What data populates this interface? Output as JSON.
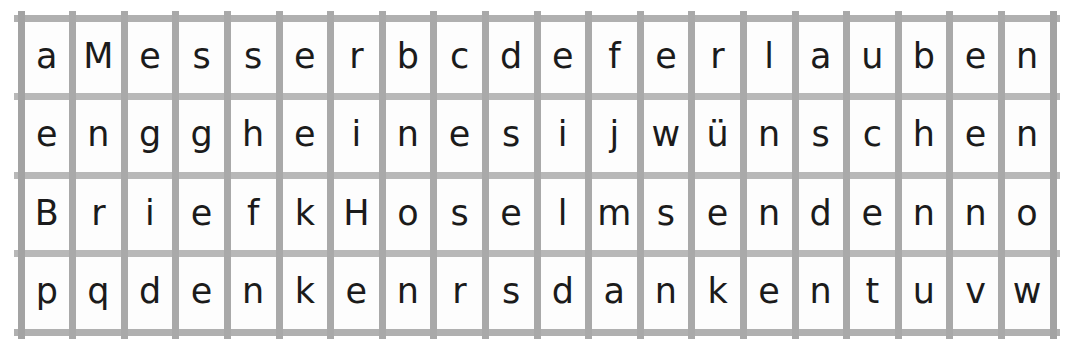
{
  "puzzle": {
    "type": "letter-grid",
    "rows": 4,
    "columns": 20,
    "grid_line_color": "#a9a9a9",
    "letter_color": "#1b1b1b",
    "cell_background": "#fdfdfd",
    "page_background": "#ffffff",
    "rows_data": [
      [
        "a",
        "M",
        "e",
        "s",
        "s",
        "e",
        "r",
        "b",
        "c",
        "d",
        "e",
        "f",
        "e",
        "r",
        "l",
        "a",
        "u",
        "b",
        "e",
        "n"
      ],
      [
        "e",
        "n",
        "g",
        "g",
        "h",
        "e",
        "i",
        "n",
        "e",
        "s",
        "i",
        "j",
        "w",
        "ü",
        "n",
        "s",
        "c",
        "h",
        "e",
        "n"
      ],
      [
        "B",
        "r",
        "i",
        "e",
        "f",
        "k",
        "H",
        "o",
        "s",
        "e",
        "l",
        "m",
        "s",
        "e",
        "n",
        "d",
        "e",
        "n",
        "n",
        "o"
      ],
      [
        "p",
        "q",
        "d",
        "e",
        "n",
        "k",
        "e",
        "n",
        "r",
        "s",
        "d",
        "a",
        "n",
        "k",
        "e",
        "n",
        "t",
        "u",
        "v",
        "w"
      ]
    ],
    "row_strings": [
      "aMesserbcdeferlauben",
      "engghein esijwünschen",
      "BriefkHoselmsendenno",
      "pqdenkenrsdankentuvw"
    ]
  }
}
